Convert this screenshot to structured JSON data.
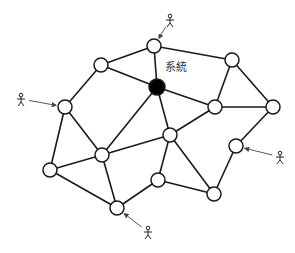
{
  "diagram": {
    "label": "系統",
    "label_pos": [
      165,
      71
    ],
    "colors": {
      "line": "#1a1a1a",
      "node_fill": "#ffffff",
      "system_fill": "#000000",
      "arrow": "#444444",
      "bg": "#ffffff"
    },
    "nodes": [
      {
        "id": "n1",
        "x": 154,
        "y": 46,
        "type": "node"
      },
      {
        "id": "n2",
        "x": 101,
        "y": 65,
        "type": "node"
      },
      {
        "id": "n3",
        "x": 232,
        "y": 60,
        "type": "node"
      },
      {
        "id": "n4",
        "x": 65,
        "y": 107,
        "type": "node"
      },
      {
        "id": "sys",
        "x": 157,
        "y": 87,
        "type": "system"
      },
      {
        "id": "n5",
        "x": 215,
        "y": 107,
        "type": "node"
      },
      {
        "id": "n6",
        "x": 273,
        "y": 107,
        "type": "node"
      },
      {
        "id": "n7",
        "x": 170,
        "y": 135,
        "type": "node"
      },
      {
        "id": "n8",
        "x": 236,
        "y": 146,
        "type": "node"
      },
      {
        "id": "n9",
        "x": 102,
        "y": 155,
        "type": "node"
      },
      {
        "id": "n10",
        "x": 50,
        "y": 170,
        "type": "node"
      },
      {
        "id": "n11",
        "x": 158,
        "y": 180,
        "type": "node"
      },
      {
        "id": "n12",
        "x": 214,
        "y": 194,
        "type": "node"
      },
      {
        "id": "n13",
        "x": 117,
        "y": 208,
        "type": "node"
      }
    ],
    "edges": [
      [
        "n2",
        "n1"
      ],
      [
        "n2",
        "sys"
      ],
      [
        "n1",
        "sys"
      ],
      [
        "n1",
        "n3"
      ],
      [
        "n2",
        "n4"
      ],
      [
        "sys",
        "n5"
      ],
      [
        "sys",
        "n9"
      ],
      [
        "sys",
        "n7"
      ],
      [
        "n3",
        "n5"
      ],
      [
        "n3",
        "n6"
      ],
      [
        "n5",
        "n6"
      ],
      [
        "n5",
        "n7"
      ],
      [
        "n6",
        "n8"
      ],
      [
        "n8",
        "n12"
      ],
      [
        "n4",
        "n9"
      ],
      [
        "n4",
        "n10"
      ],
      [
        "n9",
        "n7"
      ],
      [
        "n9",
        "n10"
      ],
      [
        "n9",
        "n13"
      ],
      [
        "n10",
        "n13"
      ],
      [
        "n7",
        "n11"
      ],
      [
        "n7",
        "n12"
      ],
      [
        "n11",
        "n12"
      ],
      [
        "n11",
        "n13"
      ]
    ],
    "users": [
      {
        "id": "u1",
        "x": 170,
        "y": 20,
        "target": "n1"
      },
      {
        "id": "u2",
        "x": 21,
        "y": 99,
        "target": "n4"
      },
      {
        "id": "u3",
        "x": 280,
        "y": 157,
        "target": "n8"
      },
      {
        "id": "u4",
        "x": 148,
        "y": 232,
        "target": "n13"
      }
    ]
  }
}
